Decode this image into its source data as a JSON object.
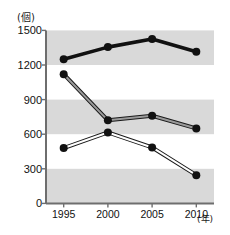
{
  "chart_data": {
    "type": "line",
    "title": "",
    "xlabel": "(年)",
    "ylabel": "(個)",
    "categories": [
      "1995",
      "2000",
      "2005",
      "2010"
    ],
    "x": [
      1995,
      2000,
      2005,
      2010
    ],
    "xlim": [
      1993,
      2012
    ],
    "ylim": [
      0,
      1500
    ],
    "yticks": [
      0,
      300,
      600,
      900,
      1200,
      1500
    ],
    "ytick_labels": [
      "0",
      "300",
      "600",
      "900",
      "1200",
      "1500"
    ],
    "grid": false,
    "banding": {
      "note": "alternating gray horizontal bands",
      "color": "#d9d9d9",
      "ranges": [
        [
          0,
          300
        ],
        [
          600,
          900
        ],
        [
          1200,
          1500
        ]
      ]
    },
    "legend": "none",
    "series": [
      {
        "name": "series-1",
        "style": "thick-solid-black",
        "color": "#111111",
        "values": [
          1250,
          1355,
          1425,
          1315
        ]
      },
      {
        "name": "series-2",
        "style": "gray-filled-double-line",
        "color": "#9a9a9a",
        "values": [
          1120,
          720,
          760,
          650
        ]
      },
      {
        "name": "series-3",
        "style": "white-filled-double-line",
        "color": "#ffffff",
        "values": [
          480,
          615,
          485,
          245
        ]
      }
    ],
    "marker": "filled-circle-black"
  },
  "axis": {
    "y_unit": "(個)",
    "x_unit": "(年)",
    "y_tick_0": "0",
    "y_tick_300": "300",
    "y_tick_600": "600",
    "y_tick_900": "900",
    "y_tick_1200": "1200",
    "y_tick_1500": "1500",
    "x_tick_0": "1995",
    "x_tick_1": "2000",
    "x_tick_2": "2005",
    "x_tick_3": "2010"
  },
  "colors": {
    "band": "#d9d9d9",
    "axis": "#6e6e6e",
    "ink": "#111111",
    "series2_fill": "#9a9a9a",
    "series3_fill": "#ffffff"
  }
}
